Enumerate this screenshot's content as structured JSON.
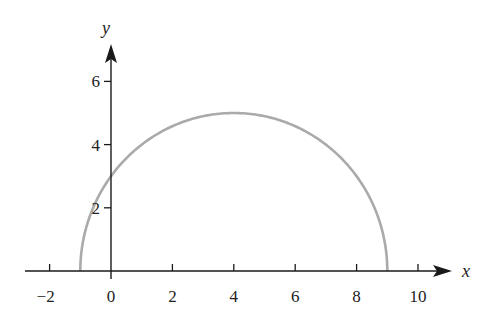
{
  "chart_data": {
    "type": "line",
    "title": "",
    "xlabel": "x",
    "ylabel": "y",
    "xlim": [
      -2.9,
      11.3
    ],
    "ylim": [
      0,
      7.2
    ],
    "x_ticks": [
      -2,
      0,
      2,
      4,
      6,
      8,
      10
    ],
    "x_tick_labels": [
      "−2",
      "0",
      "2",
      "4",
      "6",
      "8",
      "10"
    ],
    "y_ticks": [
      2,
      4,
      6
    ],
    "y_tick_labels": [
      "2",
      "4",
      "6"
    ],
    "grid": false,
    "legend": null,
    "series": [
      {
        "name": "upper semicircle",
        "description": "y = sqrt(25 - (x - 4)^2), centre (4, 0), radius 5",
        "color": "#aaaaaa",
        "x": [
          -1,
          -0.5,
          0,
          1,
          2,
          3,
          4,
          5,
          6,
          7,
          8,
          8.5,
          9
        ],
        "y": [
          0,
          2.18,
          3,
          4,
          4.58,
          4.9,
          5,
          4.9,
          4.58,
          4,
          3,
          2.18,
          0
        ]
      }
    ]
  },
  "colors": {
    "axis": "#1a1a1a",
    "curve": "#aaaaaa",
    "background": "#ffffff"
  }
}
